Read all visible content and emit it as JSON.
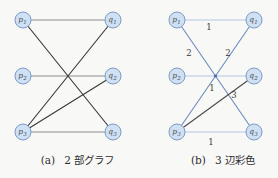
{
  "figure": {
    "colors": {
      "background": "#f8f8f7",
      "node_fill": "#cfe0f2",
      "node_stroke": "#7b9cc8",
      "node_text": "#45505c",
      "edge_gray": "#8c8c8c",
      "edge_black": "#3a3a3a",
      "color1": "#b3c8e4",
      "color2": "#6e8fc0",
      "color3": "#4a4a4a",
      "label_text": "#3a3a3a",
      "caption_text": "#2e2e2e",
      "crossing_dot": "#4a6fa5"
    },
    "graphs": [
      {
        "id": "a",
        "caption_index": "(a)",
        "caption_text": "2 部グラフ",
        "nodes": [
          {
            "id": "p1",
            "label": "p",
            "sub": "1",
            "x": 23,
            "y": 20
          },
          {
            "id": "p2",
            "label": "p",
            "sub": "2",
            "x": 23,
            "y": 76
          },
          {
            "id": "p3",
            "label": "p",
            "sub": "3",
            "x": 23,
            "y": 132
          },
          {
            "id": "q1",
            "label": "q",
            "sub": "1",
            "x": 113,
            "y": 20
          },
          {
            "id": "q2",
            "label": "q",
            "sub": "2",
            "x": 113,
            "y": 76
          },
          {
            "id": "q3",
            "label": "q",
            "sub": "3",
            "x": 113,
            "y": 132
          }
        ],
        "edges": [
          {
            "from": "p1",
            "to": "q1",
            "color": "edge_gray"
          },
          {
            "from": "p2",
            "to": "q2",
            "color": "edge_gray"
          },
          {
            "from": "p3",
            "to": "q3",
            "color": "edge_gray"
          },
          {
            "from": "p1",
            "to": "q3",
            "color": "edge_black"
          },
          {
            "from": "p3",
            "to": "q1",
            "color": "edge_black"
          },
          {
            "from": "p3",
            "to": "q2",
            "color": "edge_black"
          }
        ]
      },
      {
        "id": "b",
        "caption_index": "(b)",
        "caption_text": "3 辺彩色",
        "nodes": [
          {
            "id": "p1",
            "label": "p",
            "sub": "1",
            "x": 177,
            "y": 20
          },
          {
            "id": "p2",
            "label": "p",
            "sub": "2",
            "x": 177,
            "y": 76
          },
          {
            "id": "p3",
            "label": "p",
            "sub": "3",
            "x": 177,
            "y": 132
          },
          {
            "id": "q1",
            "label": "q",
            "sub": "1",
            "x": 254,
            "y": 20
          },
          {
            "id": "q2",
            "label": "q",
            "sub": "2",
            "x": 254,
            "y": 76
          },
          {
            "id": "q3",
            "label": "q",
            "sub": "3",
            "x": 254,
            "y": 132
          }
        ],
        "edges": [
          {
            "from": "p1",
            "to": "q1",
            "color": "color1",
            "label": "1",
            "lx": 209,
            "ly": 30
          },
          {
            "from": "p2",
            "to": "q2",
            "color": "color1",
            "label": "1",
            "lx": 212,
            "ly": 91
          },
          {
            "from": "p3",
            "to": "q3",
            "color": "color1",
            "label": "1",
            "lx": 211,
            "ly": 145
          },
          {
            "from": "p1",
            "to": "q3",
            "color": "color2",
            "label": "2",
            "lx": 189,
            "ly": 56
          },
          {
            "from": "p3",
            "to": "q1",
            "color": "color2",
            "label": "2",
            "lx": 228,
            "ly": 56
          },
          {
            "from": "p3",
            "to": "q2",
            "color": "color3",
            "label": "3",
            "lx": 234,
            "ly": 98
          }
        ],
        "crossing_dot": {
          "x": 215.5,
          "y": 76
        }
      }
    ]
  }
}
